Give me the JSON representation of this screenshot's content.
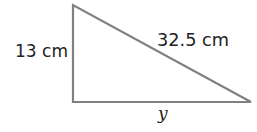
{
  "figure": {
    "type": "right-triangle",
    "stroke_color": "#808080",
    "text_color": "#222222",
    "vertices": {
      "top": [
        73,
        5
      ],
      "right_angle": [
        73,
        102
      ],
      "bottom_right": [
        251,
        102
      ]
    },
    "labels": {
      "vertical_side": "13 cm",
      "hypotenuse": "32.5 cm",
      "base": "y"
    }
  }
}
